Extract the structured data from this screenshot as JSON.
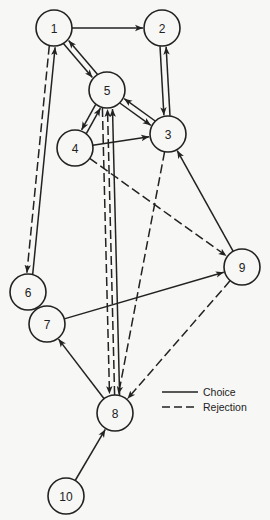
{
  "diagram": {
    "type": "directed-graph",
    "node_radius": 18,
    "nodes": [
      {
        "id": "1",
        "label": "1",
        "x": 54,
        "y": 28
      },
      {
        "id": "2",
        "label": "2",
        "x": 162,
        "y": 28
      },
      {
        "id": "5",
        "label": "5",
        "x": 107,
        "y": 90
      },
      {
        "id": "3",
        "label": "3",
        "x": 168,
        "y": 134
      },
      {
        "id": "4",
        "label": "4",
        "x": 75,
        "y": 148
      },
      {
        "id": "6",
        "label": "6",
        "x": 28,
        "y": 292
      },
      {
        "id": "7",
        "label": "7",
        "x": 47,
        "y": 324
      },
      {
        "id": "9",
        "label": "9",
        "x": 242,
        "y": 267
      },
      {
        "id": "8",
        "label": "8",
        "x": 115,
        "y": 413
      },
      {
        "id": "10",
        "label": "10",
        "x": 66,
        "y": 496
      }
    ],
    "edges": [
      {
        "from": "1",
        "to": "2",
        "type": "choice",
        "offset": 0
      },
      {
        "from": "1",
        "to": "5",
        "type": "choice",
        "offset": 3
      },
      {
        "from": "5",
        "to": "1",
        "type": "choice",
        "offset": 3
      },
      {
        "from": "2",
        "to": "3",
        "type": "choice",
        "offset": 3
      },
      {
        "from": "3",
        "to": "2",
        "type": "choice",
        "offset": 3
      },
      {
        "from": "5",
        "to": "3",
        "type": "choice",
        "offset": 3
      },
      {
        "from": "3",
        "to": "5",
        "type": "choice",
        "offset": 3
      },
      {
        "from": "4",
        "to": "5",
        "type": "choice",
        "offset": 3
      },
      {
        "from": "5",
        "to": "4",
        "type": "choice",
        "offset": 3
      },
      {
        "from": "4",
        "to": "3",
        "type": "choice",
        "offset": 0
      },
      {
        "from": "4",
        "to": "9",
        "type": "rejection",
        "offset": 0
      },
      {
        "from": "5",
        "to": "8",
        "type": "rejection",
        "offset": 5
      },
      {
        "from": "8",
        "to": "5",
        "type": "rejection",
        "offset": 0
      },
      {
        "from": "8",
        "to": "5",
        "type": "choice",
        "offset": 5
      },
      {
        "from": "3",
        "to": "8",
        "type": "rejection",
        "offset": 0
      },
      {
        "from": "9",
        "to": "3",
        "type": "choice",
        "offset": 0
      },
      {
        "from": "9",
        "to": "8",
        "type": "rejection",
        "offset": 0
      },
      {
        "from": "7",
        "to": "9",
        "type": "choice",
        "offset": 0
      },
      {
        "from": "1",
        "to": "6",
        "type": "rejection",
        "offset": 3
      },
      {
        "from": "6",
        "to": "1",
        "type": "choice",
        "offset": 3
      },
      {
        "from": "6",
        "to": "7",
        "type": "choice",
        "offset": 3
      },
      {
        "from": "7",
        "to": "6",
        "type": "choice",
        "offset": 3
      },
      {
        "from": "8",
        "to": "7",
        "type": "choice",
        "offset": 0
      },
      {
        "from": "10",
        "to": "8",
        "type": "choice",
        "offset": 0
      }
    ]
  },
  "legend": {
    "items": [
      {
        "type": "choice",
        "label": "Choice"
      },
      {
        "type": "rejection",
        "label": "Rejection"
      }
    ]
  }
}
